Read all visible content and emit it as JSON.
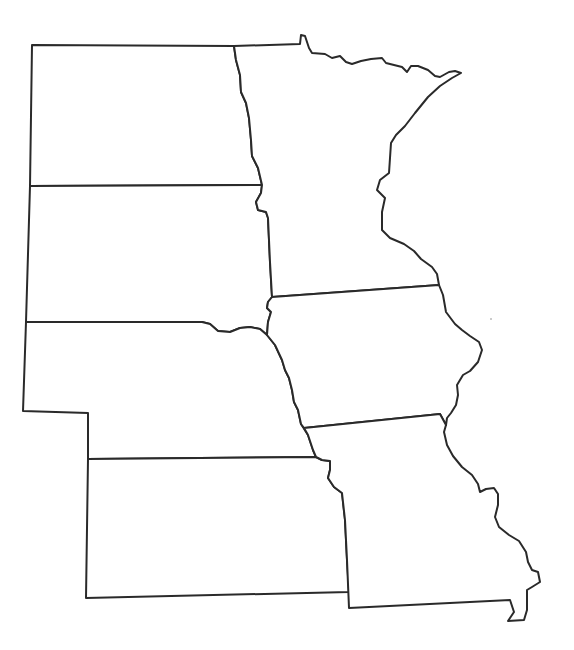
{
  "map": {
    "type": "blank outline map",
    "region": "US Upper Midwest / Great Plains",
    "stroke_color": "#2a2a2a",
    "fill_color": "#ffffff",
    "states": [
      {
        "id": "north-dakota",
        "name": "North Dakota"
      },
      {
        "id": "south-dakota",
        "name": "South Dakota"
      },
      {
        "id": "nebraska",
        "name": "Nebraska"
      },
      {
        "id": "kansas",
        "name": "Kansas"
      },
      {
        "id": "minnesota",
        "name": "Minnesota"
      },
      {
        "id": "iowa",
        "name": "Iowa"
      },
      {
        "id": "missouri",
        "name": "Missouri"
      }
    ]
  }
}
